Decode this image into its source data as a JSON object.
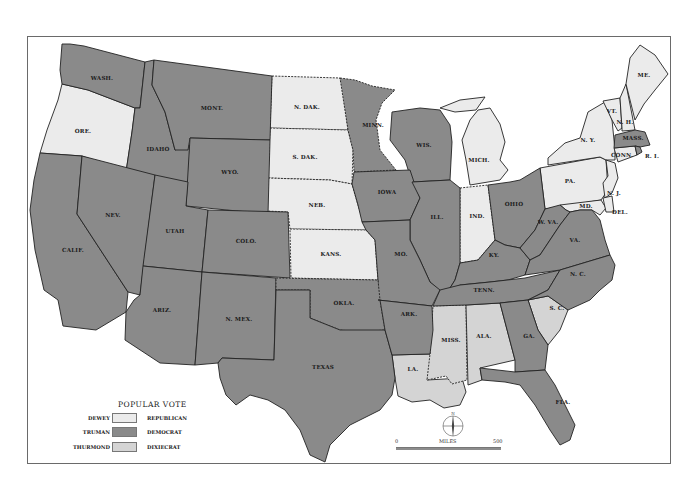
{
  "legend": {
    "title": "POPULAR VOTE",
    "rows": [
      {
        "candidate": "DEWEY",
        "party": "REPUBLICAN",
        "color": "#ebebeb"
      },
      {
        "candidate": "TRUMAN",
        "party": "DEMOCRAT",
        "color": "#8a8a8a"
      },
      {
        "candidate": "THURMOND",
        "party": "DIXIECRAT",
        "color": "#d4d4d4"
      }
    ]
  },
  "scale": {
    "start": "0",
    "unit": "MILES",
    "end": "500"
  },
  "compass": {
    "north": "N"
  },
  "colors": {
    "republican": "#ebebeb",
    "democrat": "#8a8a8a",
    "dixiecrat": "#d4d4d4",
    "border": "#222222"
  },
  "states": {
    "wash": "WASH.",
    "ore": "ORE.",
    "calif": "CALIF.",
    "idaho": "IDAHO",
    "nev": "NEV.",
    "mont": "MONT.",
    "wyo": "WYO.",
    "utah": "UTAH",
    "ariz": "ARIZ.",
    "colo": "COLO.",
    "nmex": "N. MEX.",
    "ndak": "N. DAK.",
    "sdak": "S. DAK.",
    "neb": "NEB.",
    "kans": "KANS.",
    "okla": "OKLA.",
    "texas": "TEXAS",
    "minn": "MINN.",
    "iowa": "IOWA",
    "mo": "MO.",
    "ark": "ARK.",
    "la": "LA.",
    "wis": "WIS.",
    "ill": "ILL.",
    "mich": "MICH.",
    "ind": "IND.",
    "ohio": "OHIO",
    "ky": "KY.",
    "tenn": "TENN.",
    "miss": "MISS.",
    "ala": "ALA.",
    "ga": "GA.",
    "fla": "FLA.",
    "sc": "S. C.",
    "nc": "N. C.",
    "va": "VA.",
    "wva": "W. VA.",
    "md": "MD.",
    "del": "DEL.",
    "nj": "N. J.",
    "pa": "PA.",
    "ny": "N. Y.",
    "vt": "VT.",
    "nh": "N. H.",
    "me": "ME.",
    "mass": "MASS.",
    "conn": "CONN.",
    "ri": "R. I."
  }
}
